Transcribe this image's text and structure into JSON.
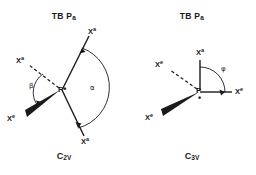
{
  "figure": {
    "type": "chemical-structure-diagram",
    "background_color": "#ffffff",
    "stroke_color": "#1a1a1a"
  },
  "panels": [
    {
      "id": "left",
      "title_main": "TB P",
      "title_sub": "a",
      "caption_main": "C",
      "caption_sub": "2V",
      "center_atom": "P",
      "lone_pair": "•",
      "substituents": [
        {
          "name": "axial-upper-right",
          "element": "X",
          "superscript": "a",
          "bond": "plain"
        },
        {
          "name": "axial-lower-right",
          "element": "X",
          "superscript": "a",
          "bond": "plain"
        },
        {
          "name": "equatorial-upper-left",
          "element": "X",
          "superscript": "a",
          "bond": "dashed"
        },
        {
          "name": "equatorial-lower-left",
          "element": "X",
          "superscript": "e",
          "bond": "wedge"
        }
      ],
      "angles": [
        {
          "name": "alpha",
          "symbol": "α"
        },
        {
          "name": "beta",
          "symbol": "β"
        }
      ]
    },
    {
      "id": "right",
      "title_main": "TB P",
      "title_sub": "a",
      "caption_main": "C",
      "caption_sub": "3V",
      "center_atom": "P",
      "lone_pair": "•",
      "substituents": [
        {
          "name": "axial-up",
          "element": "X",
          "superscript": "a",
          "bond": "plain"
        },
        {
          "name": "equatorial-right",
          "element": "X",
          "superscript": "e",
          "bond": "plain"
        },
        {
          "name": "equatorial-upper-left",
          "element": "X",
          "superscript": "e",
          "bond": "dashed"
        },
        {
          "name": "equatorial-lower-left",
          "element": "X",
          "superscript": "e",
          "bond": "wedge"
        }
      ],
      "angles": [
        {
          "name": "phi",
          "symbol": "φ"
        }
      ]
    }
  ]
}
